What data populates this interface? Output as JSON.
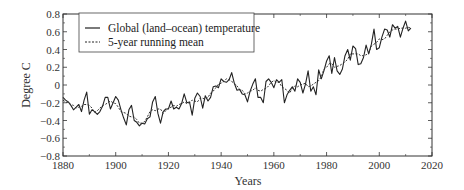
{
  "chart_data": {
    "type": "line",
    "title": "",
    "xlabel": "Years",
    "ylabel": "Degree C",
    "xlim": [
      1880,
      2020
    ],
    "ylim": [
      -0.8,
      0.8
    ],
    "xticks": [
      1880,
      1900,
      1920,
      1940,
      1960,
      1980,
      2000,
      2020
    ],
    "yticks": [
      -0.8,
      -0.6,
      -0.4,
      -0.2,
      0,
      0.2,
      0.4,
      0.6,
      0.8
    ],
    "ytick_labels": [
      "−0.8",
      "−0.6",
      "−0.4",
      "−0.2",
      "0",
      "0.2",
      "0.4",
      "0.6",
      "0.8"
    ],
    "grid": false,
    "legend_position": "upper left",
    "x": [
      1880,
      1881,
      1882,
      1883,
      1884,
      1885,
      1886,
      1887,
      1888,
      1889,
      1890,
      1891,
      1892,
      1893,
      1894,
      1895,
      1896,
      1897,
      1898,
      1899,
      1900,
      1901,
      1902,
      1903,
      1904,
      1905,
      1906,
      1907,
      1908,
      1909,
      1910,
      1911,
      1912,
      1913,
      1914,
      1915,
      1916,
      1917,
      1918,
      1919,
      1920,
      1921,
      1922,
      1923,
      1924,
      1925,
      1926,
      1927,
      1928,
      1929,
      1930,
      1931,
      1932,
      1933,
      1934,
      1935,
      1936,
      1937,
      1938,
      1939,
      1940,
      1941,
      1942,
      1943,
      1944,
      1945,
      1946,
      1947,
      1948,
      1949,
      1950,
      1951,
      1952,
      1953,
      1954,
      1955,
      1956,
      1957,
      1958,
      1959,
      1960,
      1961,
      1962,
      1963,
      1964,
      1965,
      1966,
      1967,
      1968,
      1969,
      1970,
      1971,
      1972,
      1973,
      1974,
      1975,
      1976,
      1977,
      1978,
      1979,
      1980,
      1981,
      1982,
      1983,
      1984,
      1985,
      1986,
      1987,
      1988,
      1989,
      1990,
      1991,
      1992,
      1993,
      1994,
      1995,
      1996,
      1997,
      1998,
      1999,
      2000,
      2001,
      2002,
      2003,
      2004,
      2005,
      2006,
      2007,
      2008,
      2009,
      2010,
      2011,
      2012
    ],
    "series": [
      {
        "name": "Global (land–ocean) temperature",
        "style": "solid",
        "values": [
          -0.14,
          -0.17,
          -0.19,
          -0.23,
          -0.28,
          -0.25,
          -0.22,
          -0.3,
          -0.17,
          -0.08,
          -0.33,
          -0.28,
          -0.3,
          -0.33,
          -0.3,
          -0.24,
          -0.14,
          -0.14,
          -0.27,
          -0.2,
          -0.13,
          -0.17,
          -0.28,
          -0.37,
          -0.45,
          -0.28,
          -0.23,
          -0.4,
          -0.42,
          -0.46,
          -0.43,
          -0.44,
          -0.38,
          -0.36,
          -0.19,
          -0.13,
          -0.32,
          -0.43,
          -0.3,
          -0.27,
          -0.27,
          -0.18,
          -0.27,
          -0.25,
          -0.27,
          -0.21,
          -0.1,
          -0.2,
          -0.19,
          -0.34,
          -0.15,
          -0.09,
          -0.13,
          -0.26,
          -0.12,
          -0.18,
          -0.14,
          -0.02,
          -0.01,
          -0.03,
          0.07,
          0.04,
          0.03,
          0.06,
          0.14,
          0.02,
          -0.06,
          -0.05,
          -0.1,
          -0.11,
          -0.19,
          -0.07,
          0.01,
          0.07,
          -0.14,
          -0.14,
          -0.2,
          0.04,
          0.07,
          0.03,
          -0.03,
          0.06,
          0.03,
          0.06,
          -0.2,
          -0.11,
          -0.06,
          -0.02,
          -0.07,
          0.07,
          0.03,
          -0.09,
          0.01,
          0.16,
          -0.07,
          -0.02,
          -0.11,
          0.17,
          0.07,
          0.16,
          0.27,
          0.33,
          0.13,
          0.31,
          0.16,
          0.12,
          0.18,
          0.33,
          0.4,
          0.28,
          0.44,
          0.41,
          0.23,
          0.24,
          0.31,
          0.45,
          0.35,
          0.46,
          0.63,
          0.4,
          0.42,
          0.54,
          0.63,
          0.62,
          0.54,
          0.68,
          0.64,
          0.66,
          0.54,
          0.64,
          0.72,
          0.61,
          0.64
        ]
      },
      {
        "name": "5-year running mean",
        "style": "dashed",
        "values": [
          -0.17,
          -0.19,
          -0.2,
          -0.22,
          -0.23,
          -0.26,
          -0.25,
          -0.24,
          -0.22,
          -0.22,
          -0.23,
          -0.26,
          -0.31,
          -0.29,
          -0.26,
          -0.23,
          -0.22,
          -0.2,
          -0.18,
          -0.2,
          -0.21,
          -0.25,
          -0.3,
          -0.31,
          -0.32,
          -0.35,
          -0.36,
          -0.36,
          -0.39,
          -0.43,
          -0.43,
          -0.41,
          -0.36,
          -0.3,
          -0.28,
          -0.29,
          -0.27,
          -0.27,
          -0.32,
          -0.29,
          -0.26,
          -0.25,
          -0.23,
          -0.24,
          -0.22,
          -0.21,
          -0.19,
          -0.21,
          -0.2,
          -0.17,
          -0.18,
          -0.19,
          -0.15,
          -0.15,
          -0.16,
          -0.14,
          -0.09,
          -0.07,
          -0.03,
          0.01,
          0.02,
          0.04,
          0.07,
          0.06,
          0.04,
          0.02,
          -0.01,
          -0.05,
          -0.06,
          -0.1,
          -0.09,
          -0.07,
          -0.06,
          -0.03,
          -0.06,
          -0.07,
          -0.05,
          -0.04,
          -0.01,
          0.03,
          0.05,
          0.03,
          0.03,
          -0.02,
          -0.04,
          -0.06,
          -0.09,
          -0.04,
          -0.01,
          -0.02,
          0.0,
          0.01,
          0.02,
          -0.02,
          -0.01,
          0.01,
          0.03,
          0.05,
          0.09,
          0.18,
          0.2,
          0.24,
          0.24,
          0.2,
          0.21,
          0.22,
          0.24,
          0.26,
          0.29,
          0.35,
          0.35,
          0.35,
          0.35,
          0.33,
          0.33,
          0.34,
          0.36,
          0.44,
          0.46,
          0.48,
          0.52,
          0.51,
          0.52,
          0.56,
          0.6,
          0.62,
          0.63,
          0.63,
          0.64,
          0.64,
          0.64,
          0.65,
          0.64
        ]
      }
    ]
  }
}
